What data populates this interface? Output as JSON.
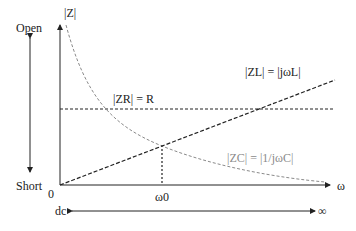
{
  "diagram": {
    "y_axis_label": "|Z|",
    "x_axis_label": "ω",
    "origin_label": "0",
    "open_label": "Open",
    "short_label": "Short",
    "resonance_label": "ω0",
    "dc_label": "dc",
    "infinity_label": "∞",
    "curves": {
      "inductor": {
        "name": "|ZL| = |jωL|",
        "style": "dashed",
        "color": "#222222"
      },
      "resistor": {
        "name": "|ZR| = R",
        "style": "dashed",
        "color": "#222222"
      },
      "capacitor": {
        "name": "|ZC| = |1/jωC|",
        "style": "dashed",
        "color": "#8a8a8a"
      }
    }
  }
}
